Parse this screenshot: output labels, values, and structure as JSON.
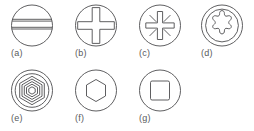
{
  "figure": {
    "stroke_color": "#4d4d4f",
    "label_color": "#58595b",
    "background_color": "#ffffff",
    "rows": [
      {
        "items": [
          {
            "label": "(a)",
            "icon": "slotted-drive-icon",
            "name": "slotted"
          },
          {
            "label": "(b)",
            "icon": "phillips-cross-drive-icon",
            "name": "phillips"
          },
          {
            "label": "(c)",
            "icon": "pozidriv-drive-icon",
            "name": "pozidriv"
          },
          {
            "label": "(d)",
            "icon": "torx-star-drive-icon",
            "name": "torx"
          }
        ]
      },
      {
        "items": [
          {
            "label": "(e)",
            "icon": "spline-hex-drive-icon",
            "name": "spline"
          },
          {
            "label": "(f)",
            "icon": "hex-socket-drive-icon",
            "name": "hex-socket"
          },
          {
            "label": "(g)",
            "icon": "square-socket-drive-icon",
            "name": "square-socket"
          }
        ]
      }
    ]
  }
}
